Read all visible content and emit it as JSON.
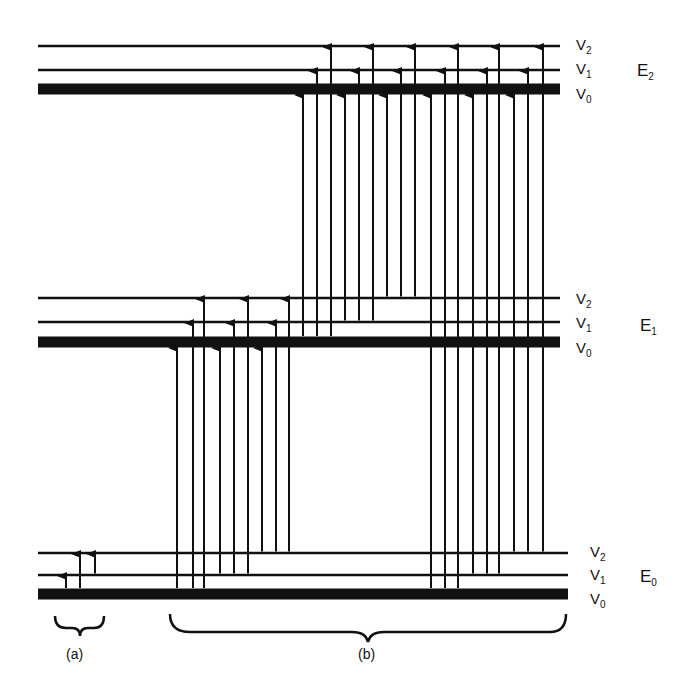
{
  "levels": [
    {
      "electronic": "E",
      "sub": "2",
      "y": {
        "V0": 89,
        "V1": 70,
        "V2": 46
      }
    },
    {
      "electronic": "E",
      "sub": "1",
      "y": {
        "V0": 342,
        "V1": 322,
        "V2": 298
      }
    },
    {
      "electronic": "E",
      "sub": "0",
      "y": {
        "V0": 594,
        "V1": 575,
        "V2": 553
      }
    }
  ],
  "vib_labels": [
    {
      "v": "V",
      "sub": "2"
    },
    {
      "v": "V",
      "sub": "1"
    },
    {
      "v": "V",
      "sub": "0"
    }
  ],
  "line_x": [
    38,
    560
  ],
  "groups": {
    "a": {
      "label": "(a)",
      "description": "pure vibrational transitions within E0"
    },
    "b": {
      "label": "(b)",
      "description": "vibronic transitions between electronic states"
    }
  },
  "transitions": {
    "a": [
      {
        "x": 66,
        "from": [
          "0",
          "V0"
        ],
        "to": [
          "0",
          "V1"
        ]
      },
      {
        "x": 80,
        "from": [
          "0",
          "V0"
        ],
        "to": [
          "0",
          "V2"
        ]
      },
      {
        "x": 95,
        "from": [
          "0",
          "V1"
        ],
        "to": [
          "0",
          "V2"
        ]
      }
    ],
    "E0_E1": [
      {
        "x": 177,
        "from": "V0",
        "to": "V0"
      },
      {
        "x": 193,
        "from": "V0",
        "to": "V1"
      },
      {
        "x": 204,
        "from": "V0",
        "to": "V2"
      },
      {
        "x": 220,
        "from": "V1",
        "to": "V0"
      },
      {
        "x": 234,
        "from": "V1",
        "to": "V1"
      },
      {
        "x": 248,
        "from": "V1",
        "to": "V2"
      },
      {
        "x": 262,
        "from": "V2",
        "to": "V0"
      },
      {
        "x": 276,
        "from": "V2",
        "to": "V1"
      },
      {
        "x": 289,
        "from": "V2",
        "to": "V2"
      }
    ],
    "E1_E2": [
      {
        "x": 303,
        "from": "V0",
        "to": "V0"
      },
      {
        "x": 317,
        "from": "V0",
        "to": "V1"
      },
      {
        "x": 331,
        "from": "V0",
        "to": "V2"
      },
      {
        "x": 345,
        "from": "V1",
        "to": "V0"
      },
      {
        "x": 359,
        "from": "V1",
        "to": "V1"
      },
      {
        "x": 373,
        "from": "V1",
        "to": "V2"
      },
      {
        "x": 387,
        "from": "V2",
        "to": "V0"
      },
      {
        "x": 401,
        "from": "V2",
        "to": "V1"
      },
      {
        "x": 415,
        "from": "V2",
        "to": "V2"
      }
    ],
    "E0_E2": [
      {
        "x": 431,
        "from": "V0",
        "to": "V0"
      },
      {
        "x": 445,
        "from": "V0",
        "to": "V1"
      },
      {
        "x": 458,
        "from": "V0",
        "to": "V2"
      },
      {
        "x": 473,
        "from": "V1",
        "to": "V0"
      },
      {
        "x": 487,
        "from": "V1",
        "to": "V1"
      },
      {
        "x": 499,
        "from": "V1",
        "to": "V2"
      },
      {
        "x": 514,
        "from": "V2",
        "to": "V0"
      },
      {
        "x": 528,
        "from": "V2",
        "to": "V1"
      },
      {
        "x": 543,
        "from": "V2",
        "to": "V2"
      }
    ]
  }
}
